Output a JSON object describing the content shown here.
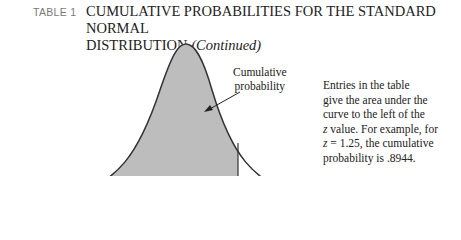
{
  "header": {
    "table_label": "TABLE 1",
    "title_line1": "CUMULATIVE PROBABILITIES FOR THE STANDARD NORMAL",
    "title_line2": "DISTRIBUTION",
    "title_suffix": "(Continued)"
  },
  "figure": {
    "annotation_line1": "Cumulative",
    "annotation_line2": "probability",
    "curve_fill": "#bdbdbd",
    "curve_stroke": "#333333"
  },
  "description": {
    "line1": "Entries in the table",
    "line2": "give the area under the",
    "line3": "curve to the left of the",
    "line4_var": "z",
    "line4_rest": " value. For example, for",
    "line5_var": "z",
    "line5_rest": " = 1.25, the cumulative",
    "line6": "probability is .8944."
  }
}
